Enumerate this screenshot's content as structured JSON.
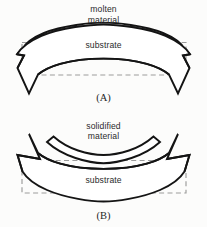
{
  "figure": {
    "background_color": "#fcfcfb",
    "line_color": "#141414",
    "dashed_color": "#9b9b9b",
    "text_color": "#2b2b2b",
    "width": 207,
    "height": 227
  },
  "panel_a": {
    "tag": "(A)",
    "upper_layer_label_line1": "molten",
    "upper_layer_label_line2": "material",
    "substrate_label": "substrate"
  },
  "panel_b": {
    "tag": "(B)",
    "upper_layer_label_line1": "solidified",
    "upper_layer_label_line2": "material",
    "substrate_label": "substrate"
  }
}
